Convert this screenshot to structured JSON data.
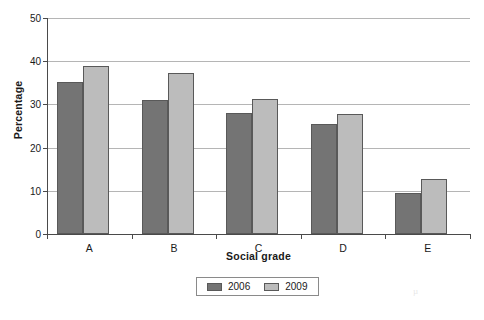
{
  "chart_data": {
    "type": "bar",
    "title": "",
    "xlabel": "Social grade",
    "ylabel": "Percentage",
    "categories": [
      "A",
      "B",
      "C",
      "D",
      "E"
    ],
    "series": [
      {
        "name": "2006",
        "color": "#747474",
        "values": [
          35.1,
          31.0,
          27.9,
          25.4,
          9.5
        ]
      },
      {
        "name": "2009",
        "color": "#bcbcbc",
        "values": [
          38.9,
          37.3,
          31.2,
          27.8,
          12.8
        ]
      }
    ],
    "ylim": [
      0,
      50
    ],
    "yticks": [
      0,
      10,
      20,
      30,
      40,
      50
    ],
    "ytick_labels": [
      "0",
      "10",
      "20",
      "30",
      "40",
      "50"
    ],
    "grid": true,
    "legend_position": "bottom-center",
    "axis_color": "#4a4a4a",
    "grid_color": "#b5b5b5",
    "background": "#ffffff"
  },
  "artifact": {
    "mark": "µ"
  }
}
